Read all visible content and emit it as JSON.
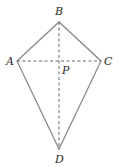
{
  "diagram": {
    "type": "kite",
    "stroke_color": "#8a8a8a",
    "dash_color": "#555555",
    "label_color": "#2a2a2a",
    "vertices": {
      "A": {
        "label": "A",
        "x": 17,
        "y": 61
      },
      "B": {
        "label": "B",
        "x": 59,
        "y": 22
      },
      "C": {
        "label": "C",
        "x": 101,
        "y": 61
      },
      "D": {
        "label": "D",
        "x": 59,
        "y": 149
      }
    },
    "intersection": {
      "label": "P",
      "x": 59,
      "y": 61
    },
    "sides": [
      "AB",
      "BC",
      "CD",
      "DA"
    ],
    "diagonals": [
      {
        "from": "A",
        "to": "C",
        "style": "dashed"
      },
      {
        "from": "B",
        "to": "D",
        "style": "dashed"
      }
    ]
  }
}
